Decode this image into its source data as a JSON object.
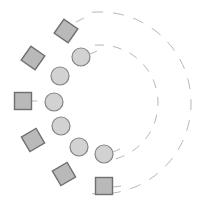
{
  "diagram": {
    "background": "#ffffff",
    "center": {
      "x": 100,
      "y": 103
    },
    "arcs": [
      {
        "name": "inner-arc",
        "radius": 58,
        "start_deg": -95,
        "end_deg": 95,
        "stroke": "#b5b5b5",
        "dash": "9 9"
      },
      {
        "name": "outer-arc",
        "radius": 91,
        "start_deg": -95,
        "end_deg": 95,
        "stroke": "#b5b5b5",
        "dash": "11 10"
      }
    ],
    "squares": {
      "fill": "#b9b9b9",
      "stroke": "#6f6f6f",
      "size": 17,
      "items": [
        {
          "x": 66,
          "y": 31,
          "rotate": 35
        },
        {
          "x": 33,
          "y": 58,
          "rotate": 35
        },
        {
          "x": 23,
          "y": 101,
          "rotate": 0
        },
        {
          "x": 33,
          "y": 140,
          "rotate": -30
        },
        {
          "x": 64,
          "y": 174,
          "rotate": -30
        },
        {
          "x": 104,
          "y": 186,
          "rotate": 0
        }
      ]
    },
    "circles": {
      "fill": "#d2d2d2",
      "stroke": "#858585",
      "radius": 9,
      "items": [
        {
          "x": 81,
          "y": 57
        },
        {
          "x": 60,
          "y": 76
        },
        {
          "x": 54,
          "y": 102
        },
        {
          "x": 61,
          "y": 126
        },
        {
          "x": 79,
          "y": 147
        },
        {
          "x": 104,
          "y": 154
        }
      ]
    },
    "connectors": {
      "stroke": "#b8b8b8",
      "items": [
        {
          "x1": 76,
          "y1": 22,
          "x2": 84,
          "y2": 18
        },
        {
          "x1": 90,
          "y1": 54,
          "x2": 97,
          "y2": 51
        },
        {
          "x1": 32,
          "y1": 101,
          "x2": 37,
          "y2": 101
        },
        {
          "x1": 113,
          "y1": 152,
          "x2": 120,
          "y2": 149
        },
        {
          "x1": 113,
          "y1": 187,
          "x2": 121,
          "y2": 186
        }
      ]
    }
  }
}
